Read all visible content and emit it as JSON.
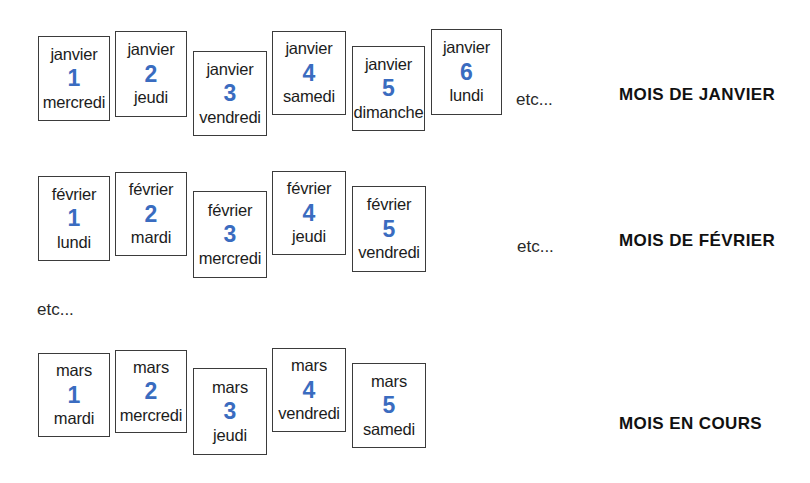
{
  "page": {
    "background_color": "#ffffff",
    "accent_color": "#3a6cc0",
    "text_color": "#1c1c1c",
    "border_color": "#3b3b3b"
  },
  "rows": [
    {
      "id": "janvier",
      "caption": "MOIS DE JANVIER",
      "etc_label": "etc...",
      "cards": [
        {
          "month": "janvier",
          "day_number": "1",
          "weekday": "mercredi"
        },
        {
          "month": "janvier",
          "day_number": "2",
          "weekday": "jeudi"
        },
        {
          "month": "janvier",
          "day_number": "3",
          "weekday": "vendredi"
        },
        {
          "month": "janvier",
          "day_number": "4",
          "weekday": "samedi"
        },
        {
          "month": "janvier",
          "day_number": "5",
          "weekday": "dimanche"
        },
        {
          "month": "janvier",
          "day_number": "6",
          "weekday": "lundi"
        }
      ]
    },
    {
      "id": "fevrier",
      "caption": "MOIS DE FÉVRIER",
      "etc_label": "etc...",
      "cards": [
        {
          "month": "février",
          "day_number": "1",
          "weekday": "lundi"
        },
        {
          "month": "février",
          "day_number": "2",
          "weekday": "mardi"
        },
        {
          "month": "février",
          "day_number": "3",
          "weekday": "mercredi"
        },
        {
          "month": "février",
          "day_number": "4",
          "weekday": "jeudi"
        },
        {
          "month": "février",
          "day_number": "5",
          "weekday": "vendredi"
        }
      ]
    },
    {
      "id": "mars",
      "caption": "MOIS EN COURS",
      "etc_label": "",
      "cards": [
        {
          "month": "mars",
          "day_number": "1",
          "weekday": "mardi"
        },
        {
          "month": "mars",
          "day_number": "2",
          "weekday": "mercredi"
        },
        {
          "month": "mars",
          "day_number": "3",
          "weekday": "jeudi"
        },
        {
          "month": "mars",
          "day_number": "4",
          "weekday": "vendredi"
        },
        {
          "month": "mars",
          "day_number": "5",
          "weekday": "samedi"
        }
      ]
    }
  ],
  "middle_etc_label": "etc..."
}
